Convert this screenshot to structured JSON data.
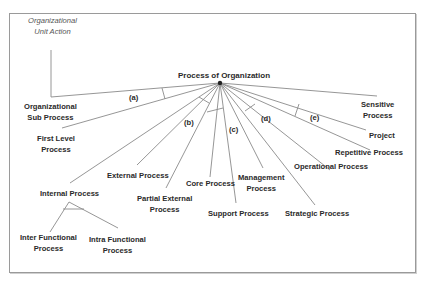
{
  "diagram": {
    "root": "Process of Organization",
    "annotation": [
      "Organizational",
      "Unit Action"
    ],
    "branches": [
      {
        "id": "org-sub",
        "lines": [
          "Organizational",
          "Sub Process"
        ]
      },
      {
        "id": "first-level",
        "lines": [
          "First Level",
          "Process"
        ]
      },
      {
        "id": "internal",
        "lines": [
          "Internal Process"
        ]
      },
      {
        "id": "external",
        "lines": [
          "External Process"
        ]
      },
      {
        "id": "partial-external",
        "lines": [
          "Partial External",
          "Process"
        ]
      },
      {
        "id": "core",
        "lines": [
          "Core Process"
        ]
      },
      {
        "id": "support",
        "lines": [
          "Support Process"
        ]
      },
      {
        "id": "management",
        "lines": [
          "Management",
          "Process"
        ]
      },
      {
        "id": "strategic",
        "lines": [
          "Strategic Process"
        ]
      },
      {
        "id": "operational",
        "lines": [
          "Operational Process"
        ]
      },
      {
        "id": "repetitive",
        "lines": [
          "Repetitive Process"
        ]
      },
      {
        "id": "project",
        "lines": [
          "Project"
        ]
      },
      {
        "id": "sensitive",
        "lines": [
          "Sensitive",
          "Process"
        ]
      }
    ],
    "sub_branches": [
      {
        "id": "inter-functional",
        "lines": [
          "Inter Functional",
          "Process"
        ]
      },
      {
        "id": "intra-functional",
        "lines": [
          "Intra Functional",
          "Process"
        ]
      }
    ],
    "groups": [
      "(a)",
      "(b)",
      "(c)",
      "(d)",
      "(e)"
    ]
  }
}
